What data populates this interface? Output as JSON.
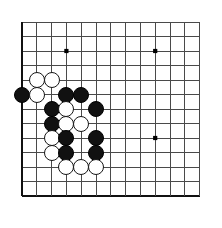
{
  "diagram": {
    "kind": "go-board-problem",
    "caption": "问题图",
    "caption_meaning_icon": "triangle-marker",
    "board": {
      "type": "go-board-partial",
      "columns": 13,
      "rows": 13,
      "origin_x": 22,
      "origin_y": 22,
      "spacing_x": 14.8,
      "spacing_y": 14.5,
      "line_color": "#4a4a4a",
      "edge_color": "#111111",
      "background_color": "#ffffff",
      "edges": {
        "left": true,
        "bottom": true,
        "top": false,
        "right": false
      },
      "star_points": [
        {
          "col": 3,
          "row": 2
        },
        {
          "col": 9,
          "row": 2
        },
        {
          "col": 9,
          "row": 8
        }
      ],
      "star_point_color": "#000000",
      "stone_diameter": 16
    },
    "stones": [
      {
        "color": "white",
        "col": 1,
        "row": 4
      },
      {
        "color": "white",
        "col": 2,
        "row": 4
      },
      {
        "color": "black",
        "col": 0,
        "row": 5
      },
      {
        "color": "white",
        "col": 1,
        "row": 5
      },
      {
        "color": "black",
        "col": 3,
        "row": 5
      },
      {
        "color": "black",
        "col": 4,
        "row": 5
      },
      {
        "color": "black",
        "col": 2,
        "row": 6
      },
      {
        "color": "white",
        "col": 3,
        "row": 6
      },
      {
        "color": "black",
        "col": 5,
        "row": 6
      },
      {
        "color": "black",
        "col": 2,
        "row": 7
      },
      {
        "color": "white",
        "col": 3,
        "row": 7
      },
      {
        "color": "white",
        "col": 4,
        "row": 7
      },
      {
        "color": "white",
        "col": 2,
        "row": 8
      },
      {
        "color": "black",
        "col": 3,
        "row": 8
      },
      {
        "color": "black",
        "col": 5,
        "row": 8
      },
      {
        "color": "white",
        "col": 2,
        "row": 9
      },
      {
        "color": "black",
        "col": 3,
        "row": 9
      },
      {
        "color": "black",
        "col": 5,
        "row": 9
      },
      {
        "color": "white",
        "col": 3,
        "row": 10
      },
      {
        "color": "white",
        "col": 4,
        "row": 10
      },
      {
        "color": "white",
        "col": 5,
        "row": 10
      }
    ],
    "counts": {
      "black_stones": 10,
      "white_stones": 11,
      "total_stones": 21
    }
  }
}
